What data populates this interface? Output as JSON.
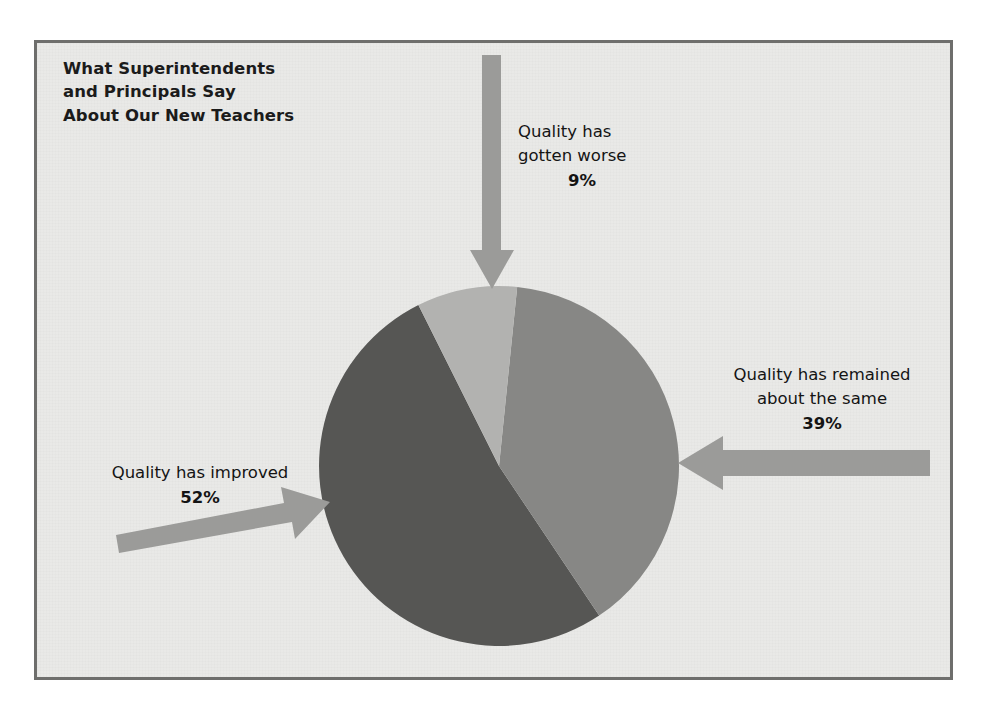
{
  "figure": {
    "title": "What Superintendents\nand Principals Say\nAbout Our New Teachers",
    "background_color": "#e9e9e7",
    "border_color": "#6e6e6c",
    "page_color": "#ffffff"
  },
  "labels": {
    "worse": {
      "line1": "Quality has",
      "line2": "gotten worse",
      "percent": "9%"
    },
    "same": {
      "line1": "Quality has remained",
      "line2": "about the same",
      "percent": "39%"
    },
    "improved": {
      "line1": "Quality has improved",
      "percent": "52%"
    }
  },
  "arrows": {
    "color": "#9b9b99",
    "top": "arrow-down-icon",
    "right": "arrow-left-icon",
    "left": "arrow-right-icon"
  },
  "chart_data": {
    "type": "pie",
    "title": "What Superintendents and Principals Say About Our New Teachers",
    "categories": [
      "Quality has improved",
      "Quality has remained about the same",
      "Quality has gotten worse"
    ],
    "values": [
      52,
      39,
      9
    ],
    "value_labels": [
      "52%",
      "39%",
      "9%"
    ],
    "unit": "percent",
    "total": 100,
    "colors": [
      "#565654",
      "#878785",
      "#b2b2b0"
    ],
    "legend": "none",
    "labels_position": "outside-with-arrows",
    "start_angle_deg": -13,
    "direction": "clockwise",
    "slices": [
      {
        "name": "Quality has improved",
        "value": 52,
        "label": "52%",
        "color": "#565654",
        "pointer": "arrow-right-icon"
      },
      {
        "name": "Quality has remained about the same",
        "value": 39,
        "label": "39%",
        "color": "#878785",
        "pointer": "arrow-left-icon"
      },
      {
        "name": "Quality has gotten worse",
        "value": 9,
        "label": "9%",
        "color": "#b2b2b0",
        "pointer": "arrow-down-icon"
      }
    ],
    "geometry": {
      "center_x": 499,
      "center_y": 466,
      "radius": 180
    }
  }
}
